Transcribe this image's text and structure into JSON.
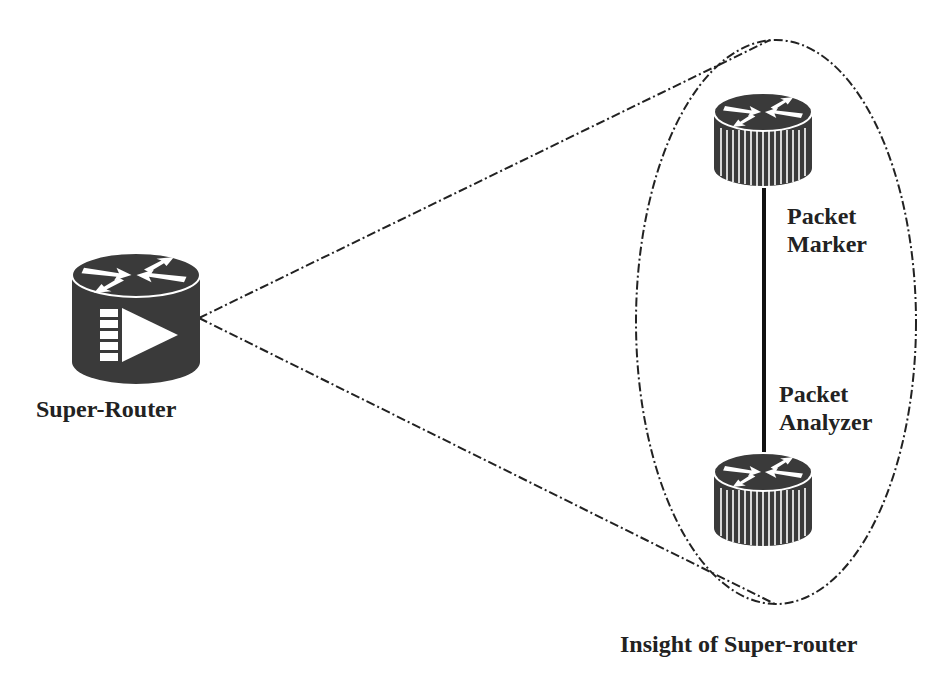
{
  "diagram": {
    "nodes": [
      {
        "id": "super-router",
        "label": "Super-Router",
        "type": "router-with-queue"
      },
      {
        "id": "packet-marker",
        "label_lines": [
          "Packet",
          "Marker"
        ],
        "type": "router"
      },
      {
        "id": "packet-analyzer",
        "label_lines": [
          "Packet",
          "Analyzer"
        ],
        "type": "router"
      }
    ],
    "edges": [
      {
        "from": "packet-marker",
        "to": "packet-analyzer",
        "style": "solid"
      }
    ],
    "zoom_cone": {
      "from": "super-router",
      "to": "insight-ellipse",
      "style": "dash-dot"
    },
    "group": {
      "id": "insight-ellipse",
      "label": "Insight of Super-router",
      "style": "dash-dot"
    },
    "colors": {
      "device": "#3a3a3a",
      "line": "#1a1a1a",
      "text": "#222222"
    }
  }
}
